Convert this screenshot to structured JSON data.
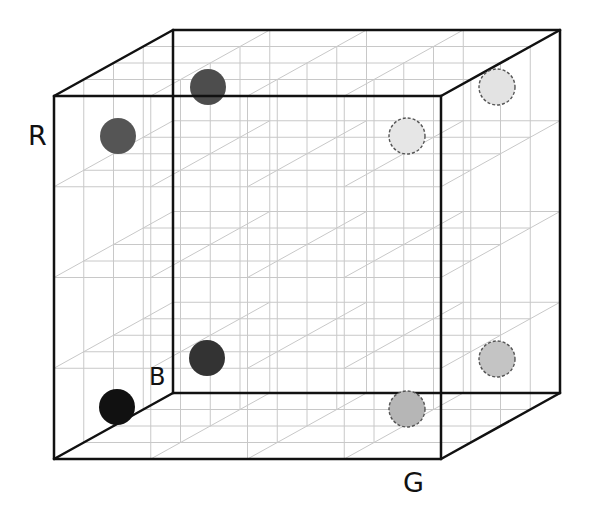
{
  "diagram": {
    "type": "rgb-color-cube",
    "grid_divisions": 4,
    "front_face": {
      "x0": 54,
      "y0": 96,
      "x1": 441,
      "y1": 459
    },
    "depth_offset": {
      "dx": 119,
      "dy": -66
    },
    "colors": {
      "edge": "#111111",
      "grid": "#c8c8c8",
      "background": "#ffffff"
    }
  },
  "axis_labels": {
    "r": {
      "text": "R",
      "x": 28,
      "y": 122,
      "size": 27
    },
    "b": {
      "text": "B",
      "x": 149,
      "y": 365,
      "size": 24
    },
    "g": {
      "text": "G",
      "x": 403,
      "y": 469,
      "size": 27
    }
  },
  "points": [
    {
      "name": "point-red-front-top-left",
      "cx": 118,
      "cy": 136,
      "r": 18,
      "fill": "#555555",
      "dashed": false
    },
    {
      "name": "point-magenta-back-top-left",
      "cx": 208,
      "cy": 87,
      "r": 18,
      "fill": "#4d4d4d",
      "dashed": false
    },
    {
      "name": "point-black-origin",
      "cx": 117,
      "cy": 407,
      "r": 18,
      "fill": "#111111",
      "dashed": false
    },
    {
      "name": "point-blue-back-bottom-left",
      "cx": 207,
      "cy": 358,
      "r": 18,
      "fill": "#333333",
      "dashed": false
    },
    {
      "name": "point-yellow-front-top-right",
      "cx": 407,
      "cy": 136,
      "r": 18,
      "fill": "#e6e6e6",
      "dashed": true
    },
    {
      "name": "point-white-back-top-right",
      "cx": 497,
      "cy": 87,
      "r": 18,
      "fill": "#e3e3e3",
      "dashed": true
    },
    {
      "name": "point-green-front-bottom-right",
      "cx": 407,
      "cy": 409,
      "r": 18,
      "fill": "#b6b6b6",
      "dashed": true
    },
    {
      "name": "point-cyan-back-bottom-right",
      "cx": 497,
      "cy": 359,
      "r": 18,
      "fill": "#c4c4c4",
      "dashed": true
    }
  ]
}
